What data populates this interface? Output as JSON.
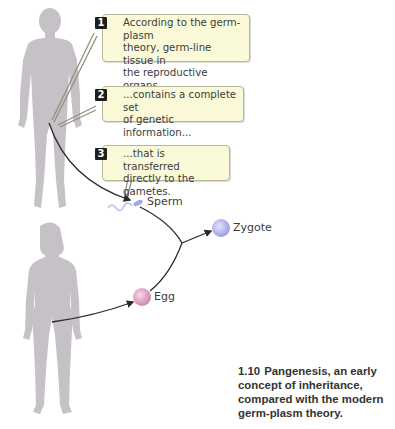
{
  "figure": {
    "number": "1.10",
    "caption": "Pangenesis, an early concept of inheritance, compared with the modern germ-plasm theory."
  },
  "callouts": [
    {
      "number": "1",
      "text": "According to the germ-plasm\ntheory, germ-line tissue in\nthe reproductive organs..."
    },
    {
      "number": "2",
      "text": "...contains a complete set\nof genetic information..."
    },
    {
      "number": "3",
      "text": "...that is transferred\ndirectly to the gametes."
    }
  ],
  "labels": {
    "sperm": "Sperm",
    "zygote": "Zygote",
    "egg": "Egg"
  },
  "figures": {
    "male": "male-silhouette",
    "female": "female-silhouette"
  },
  "colors": {
    "silhouette": "#c5c1c7",
    "callout_bg": "#fbfad8",
    "callout_border": "#b9b79a",
    "badge_bg": "#1e1e1e",
    "zygote": "#b8b9ee",
    "egg": "#e0a7c4",
    "sperm": "#a9b6ea",
    "arrow": "#2a2a2a"
  }
}
